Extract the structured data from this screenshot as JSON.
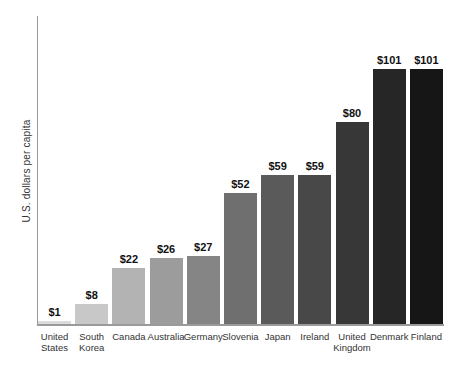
{
  "chart_data": {
    "type": "bar",
    "categories": [
      "United\nStates",
      "South\nKorea",
      "Canada",
      "Australia",
      "Germany",
      "Slovenia",
      "Japan",
      "Ireland",
      "United\nKingdom",
      "Denmark",
      "Finland"
    ],
    "values": [
      1,
      8,
      22,
      26,
      27,
      52,
      59,
      59,
      80,
      101,
      101
    ],
    "value_labels": [
      "$1",
      "$8",
      "$22",
      "$26",
      "$27",
      "$52",
      "$59",
      "$59",
      "$80",
      "$101",
      "$101"
    ],
    "bar_colors": [
      "#dcdcdc",
      "#c8c8c8",
      "#b3b3b3",
      "#9c9c9c",
      "#858585",
      "#6f6f6f",
      "#5a5a5a",
      "#484848",
      "#373737",
      "#262626",
      "#161616"
    ],
    "title": "",
    "xlabel": "",
    "ylabel": "U.S. dollars per capita",
    "ylim": [
      0,
      101
    ],
    "grid": false,
    "legend": false,
    "axis_color": "#9a9a9a"
  }
}
